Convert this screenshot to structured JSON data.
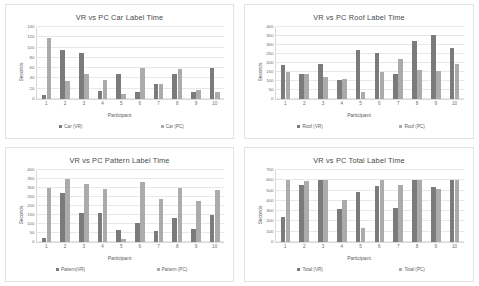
{
  "page": {
    "background_color": "#ffffff",
    "series_colors": {
      "vr": "#7b7b7b",
      "pc": "#ababab"
    }
  },
  "charts": [
    {
      "title": "VR vs PC Car Label Time",
      "xlabel": "Participant",
      "ylabel": "Seconds",
      "legend": [
        "Car (VR)",
        "Car (PC)"
      ]
    },
    {
      "title": "VR vs PC Roof Label Time",
      "xlabel": "Participant",
      "ylabel": "Seconds",
      "legend": [
        "Roof (VR)",
        "Roof (PC)"
      ]
    },
    {
      "title": "VR vs PC Pattern Label Time",
      "xlabel": "Participant",
      "ylabel": "Seconds",
      "legend": [
        "Pattern(VR)",
        "Pattern (PC)"
      ]
    },
    {
      "title": "VR vs PC Total Label Time",
      "xlabel": "Participant",
      "ylabel": "Seconds",
      "legend": [
        "Total (VR)",
        "Total (PC)"
      ]
    }
  ],
  "chart_data": [
    {
      "type": "bar",
      "title": "VR vs PC Car Label Time",
      "xlabel": "Participant",
      "ylabel": "Seconds",
      "categories": [
        "1",
        "2",
        "3",
        "4",
        "5",
        "6",
        "7",
        "8",
        "9",
        "10"
      ],
      "yticks": [
        0,
        20,
        40,
        60,
        80,
        100,
        120,
        140
      ],
      "ylim": [
        0,
        140
      ],
      "grid": true,
      "legend_position": "bottom",
      "series": [
        {
          "name": "Car (VR)",
          "color": "#7b7b7b",
          "values": [
            8,
            95,
            90,
            16,
            49,
            13,
            30,
            48,
            14,
            61
          ]
        },
        {
          "name": "Car (PC)",
          "color": "#ababab",
          "values": [
            119,
            35,
            48,
            37,
            10,
            60,
            30,
            58,
            18,
            13
          ]
        }
      ]
    },
    {
      "type": "bar",
      "title": "VR vs PC Roof Label Time",
      "xlabel": "Participant",
      "ylabel": "Seconds",
      "categories": [
        "1",
        "2",
        "3",
        "4",
        "5",
        "6",
        "7",
        "8",
        "9",
        "10"
      ],
      "yticks": [
        0,
        50,
        100,
        150,
        200,
        250,
        300,
        350,
        400
      ],
      "ylim": [
        0,
        400
      ],
      "grid": true,
      "legend_position": "bottom",
      "series": [
        {
          "name": "Roof (VR)",
          "color": "#7b7b7b",
          "values": [
            190,
            138,
            192,
            105,
            270,
            257,
            138,
            320,
            358,
            283
          ]
        },
        {
          "name": "Roof (PC)",
          "color": "#ababab",
          "values": [
            150,
            140,
            120,
            112,
            38,
            150,
            222,
            160,
            157,
            192
          ]
        }
      ]
    },
    {
      "type": "bar",
      "title": "VR vs PC Pattern Label Time",
      "xlabel": "Participant",
      "ylabel": "Seconds",
      "categories": [
        "1",
        "2",
        "3",
        "4",
        "5",
        "6",
        "7",
        "8",
        "9",
        "10"
      ],
      "yticks": [
        0,
        50,
        100,
        150,
        200,
        250,
        300,
        350,
        400
      ],
      "ylim": [
        0,
        400
      ],
      "grid": true,
      "legend_position": "bottom",
      "series": [
        {
          "name": "Pattern(VR)",
          "color": "#7b7b7b",
          "values": [
            22,
            275,
            160,
            160,
            68,
            108,
            62,
            133,
            72,
            150
          ]
        },
        {
          "name": "Pattern (PC)",
          "color": "#ababab",
          "values": [
            300,
            350,
            325,
            297,
            15,
            335,
            240,
            300,
            228,
            288
          ]
        }
      ]
    },
    {
      "type": "bar",
      "title": "VR vs PC Total Label Time",
      "xlabel": "Participant",
      "ylabel": "Seconds",
      "categories": [
        "1",
        "2",
        "3",
        "4",
        "5",
        "6",
        "7",
        "8",
        "9",
        "10"
      ],
      "yticks": [
        0,
        100,
        200,
        300,
        400,
        500,
        600,
        700
      ],
      "ylim": [
        0,
        700
      ],
      "grid": true,
      "legend_position": "bottom",
      "series": [
        {
          "name": "Total (VR)",
          "color": "#7b7b7b",
          "values": [
            245,
            555,
            600,
            318,
            490,
            545,
            330,
            600,
            535,
            600
          ]
        },
        {
          "name": "Total (PC)",
          "color": "#ababab",
          "values": [
            600,
            590,
            600,
            405,
            140,
            600,
            555,
            600,
            515,
            600
          ]
        }
      ]
    }
  ]
}
